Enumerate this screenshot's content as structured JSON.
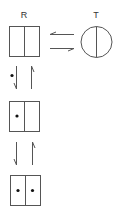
{
  "diagram": {
    "type": "state-transition",
    "labels": {
      "relaxed_state": "R",
      "tense_state": "T"
    },
    "states": [
      {
        "id": "R0",
        "shape": "split-square",
        "ligands": 0
      },
      {
        "id": "T0",
        "shape": "split-circle",
        "ligands": 0
      },
      {
        "id": "R1",
        "shape": "split-square",
        "ligands": 1
      },
      {
        "id": "R2",
        "shape": "split-square",
        "ligands": 2
      }
    ],
    "transitions": [
      {
        "from": "R0",
        "to": "T0",
        "type": "equilibrium",
        "direction": "horizontal"
      },
      {
        "from": "R0",
        "to": "R1",
        "type": "equilibrium",
        "direction": "vertical",
        "ligand_marker": "dot"
      },
      {
        "from": "R1",
        "to": "R2",
        "type": "equilibrium",
        "direction": "vertical"
      }
    ],
    "colors": {
      "stroke": "#555555",
      "dot": "#111111",
      "background": "#ffffff"
    }
  }
}
